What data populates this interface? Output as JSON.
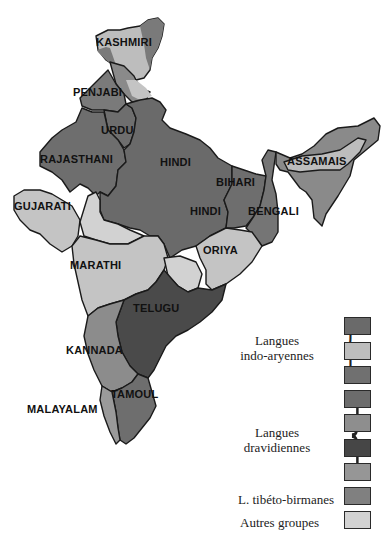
{
  "map": {
    "type": "linguistic map of India (grayscale)",
    "regions": [
      {
        "id": "kashmiri",
        "label": "KASHMIRI",
        "group": "indo-aryennes",
        "color": "#bdbdbd"
      },
      {
        "id": "penjabi",
        "label": "PENJABI",
        "group": "indo-aryennes",
        "color": "#7a7a7a"
      },
      {
        "id": "urdu",
        "label": "URDU",
        "group": "indo-aryennes",
        "color": "#6e6e6e"
      },
      {
        "id": "rajasthani",
        "label": "RAJASTHANI",
        "group": "indo-aryennes",
        "color": "#6e6e6e"
      },
      {
        "id": "hindi",
        "label": "HINDI",
        "group": "indo-aryennes",
        "color": "#6a6a6a"
      },
      {
        "id": "bihari",
        "label": "BIHARI",
        "group": "indo-aryennes",
        "color": "#6e6e6e"
      },
      {
        "id": "hindi2",
        "label": "HINDI",
        "group": "indo-aryennes",
        "color": "#6a6a6a"
      },
      {
        "id": "bengali",
        "label": "BENGALI",
        "group": "indo-aryennes",
        "color": "#757575"
      },
      {
        "id": "assamais",
        "label": "ASSAMAIS",
        "group": "indo-aryennes",
        "color": "#bdbdbd"
      },
      {
        "id": "gujarati",
        "label": "GUJARATI",
        "group": "indo-aryennes",
        "color": "#c4c4c4"
      },
      {
        "id": "oriya",
        "label": "ORIYA",
        "group": "indo-aryennes",
        "color": "#c4c4c4"
      },
      {
        "id": "marathi",
        "label": "MARATHI",
        "group": "indo-aryennes",
        "color": "#c4c4c4"
      },
      {
        "id": "telugu",
        "label": "TELUGU",
        "group": "dravidiennes",
        "color": "#4a4a4a"
      },
      {
        "id": "kannada",
        "label": "KANNADA",
        "group": "dravidiennes",
        "color": "#8c8c8c"
      },
      {
        "id": "tamoul",
        "label": "TAMOUL",
        "group": "dravidiennes",
        "color": "#6e6e6e"
      },
      {
        "id": "malayalam",
        "label": "MALAYALAM",
        "group": "dravidiennes",
        "color": "#9a9a9a"
      }
    ]
  },
  "legend": {
    "groups": [
      {
        "label_line1": "Langues",
        "label_line2": "indo-aryennes"
      },
      {
        "label_line1": "Langues",
        "label_line2": "dravidiennes"
      }
    ],
    "single_items": [
      {
        "label": "L. tibéto-birmanes"
      },
      {
        "label": "Autres groupes"
      }
    ],
    "swatches": [
      {
        "group": "indo-aryennes",
        "color": "#6a6a6a"
      },
      {
        "group": "indo-aryennes",
        "color": "#bdbdbd"
      },
      {
        "group": "indo-aryennes",
        "color": "#707070"
      },
      {
        "group": "dravidiennes",
        "color": "#6c6c6c"
      },
      {
        "group": "dravidiennes",
        "color": "#8e8e8e"
      },
      {
        "group": "dravidiennes",
        "color": "#464646"
      },
      {
        "group": "dravidiennes",
        "color": "#969696"
      },
      {
        "group": "tibeto-birmanes",
        "color": "#808080"
      },
      {
        "group": "autres",
        "color": "#d2d2d2"
      }
    ]
  }
}
